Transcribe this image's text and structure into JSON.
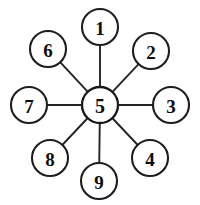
{
  "diagram": {
    "type": "star-network",
    "background_color": "#ffffff",
    "stroke_color": "#201d1d",
    "label_color": "#0d0c0c",
    "node_radius": 18,
    "hub_radius": 18,
    "hub": {
      "id": "5",
      "label": "5",
      "cx": 100,
      "cy": 105
    },
    "nodes": [
      {
        "id": "1",
        "label": "1",
        "cx": 100,
        "cy": 27,
        "position": "top"
      },
      {
        "id": "2",
        "label": "2",
        "cx": 151,
        "cy": 51,
        "position": "upper-right"
      },
      {
        "id": "3",
        "label": "3",
        "cx": 171,
        "cy": 105,
        "position": "right"
      },
      {
        "id": "4",
        "label": "4",
        "cx": 150,
        "cy": 158,
        "position": "lower-right"
      },
      {
        "id": "9",
        "label": "9",
        "cx": 99,
        "cy": 181,
        "position": "bottom"
      },
      {
        "id": "8",
        "label": "8",
        "cx": 50,
        "cy": 158,
        "position": "lower-left"
      },
      {
        "id": "7",
        "label": "7",
        "cx": 29,
        "cy": 105,
        "position": "left"
      },
      {
        "id": "6",
        "label": "6",
        "cx": 48,
        "cy": 49,
        "position": "upper-left"
      }
    ],
    "edges": [
      {
        "from": "5",
        "to": "1"
      },
      {
        "from": "5",
        "to": "2"
      },
      {
        "from": "5",
        "to": "3"
      },
      {
        "from": "5",
        "to": "4"
      },
      {
        "from": "5",
        "to": "9"
      },
      {
        "from": "5",
        "to": "8"
      },
      {
        "from": "5",
        "to": "7"
      },
      {
        "from": "5",
        "to": "6"
      }
    ]
  }
}
